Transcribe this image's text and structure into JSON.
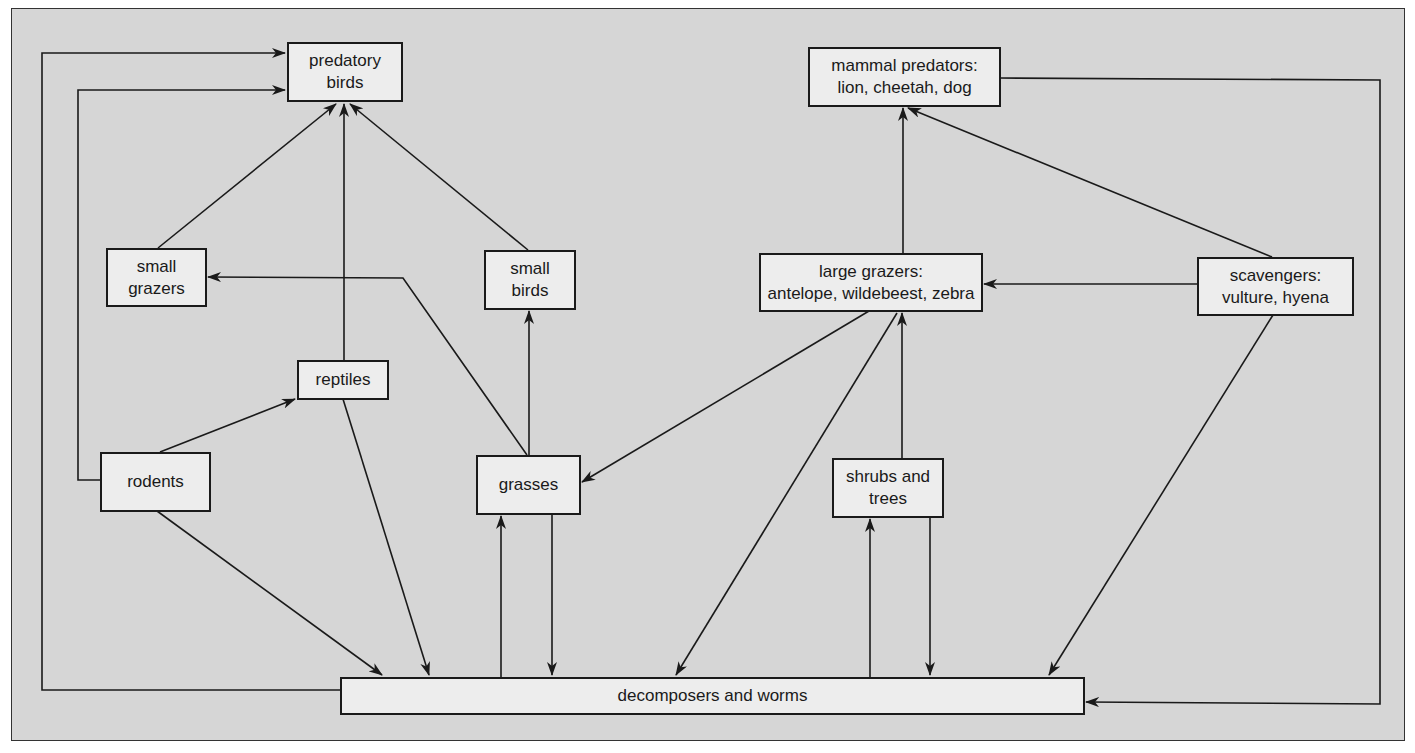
{
  "diagram": {
    "type": "food-web",
    "colors": {
      "background": "#d6d6d6",
      "box_fill": "#ededed",
      "stroke": "#1a1a1a"
    },
    "nodes": {
      "predatory_birds": "predatory\nbirds",
      "mammal_predators": "mammal predators:\nlion, cheetah, dog",
      "small_grazers": "small\ngrazers",
      "small_birds": "small\nbirds",
      "large_grazers": "large grazers:\nantelope, wildebeest, zebra",
      "scavengers": "scavengers:\nvulture, hyena",
      "reptiles": "reptiles",
      "rodents": "rodents",
      "grasses": "grasses",
      "shrubs_trees": "shrubs and\ntrees",
      "decomposers": "decomposers and worms"
    },
    "edges": [
      {
        "from": "small grazers",
        "to": "predatory birds"
      },
      {
        "from": "reptiles",
        "to": "predatory birds"
      },
      {
        "from": "small birds",
        "to": "predatory birds"
      },
      {
        "from": "rodents",
        "to": "predatory birds"
      },
      {
        "from": "decomposers and worms",
        "to": "predatory birds"
      },
      {
        "from": "rodents",
        "to": "reptiles"
      },
      {
        "from": "grasses",
        "to": "small grazers"
      },
      {
        "from": "grasses",
        "to": "small birds"
      },
      {
        "from": "large grazers",
        "to": "grasses"
      },
      {
        "from": "large grazers",
        "to": "mammal predators"
      },
      {
        "from": "scavengers",
        "to": "mammal predators"
      },
      {
        "from": "scavengers",
        "to": "large grazers"
      },
      {
        "from": "shrubs and trees",
        "to": "large grazers"
      },
      {
        "from": "large grazers",
        "to": "decomposers and worms"
      },
      {
        "from": "rodents",
        "to": "decomposers and worms"
      },
      {
        "from": "reptiles",
        "to": "decomposers and worms"
      },
      {
        "from": "decomposers and worms",
        "to": "grasses"
      },
      {
        "from": "grasses",
        "to": "decomposers and worms"
      },
      {
        "from": "decomposers and worms",
        "to": "shrubs and trees"
      },
      {
        "from": "shrubs and trees",
        "to": "decomposers and worms"
      },
      {
        "from": "scavengers",
        "to": "decomposers and worms"
      },
      {
        "from": "mammal predators",
        "to": "decomposers and worms"
      }
    ]
  }
}
